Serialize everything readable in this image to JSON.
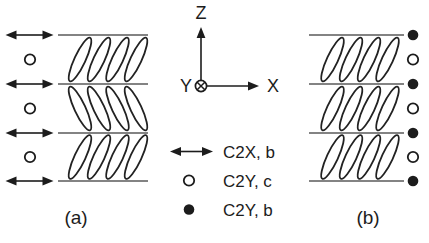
{
  "colors": {
    "background": "#ffffff",
    "ink": "#1c1c1c",
    "layer_line": "#5a5a5a"
  },
  "axes": {
    "z_label": "Z",
    "x_label": "X",
    "y_label": "Y",
    "y_direction_icon": "into-page-circled-x"
  },
  "legend": {
    "items": [
      {
        "symbol": "double-arrow",
        "label": "C2X, b"
      },
      {
        "symbol": "open-circle",
        "label": "C2Y, c"
      },
      {
        "symbol": "filled-circle",
        "label": "C2Y, b"
      }
    ]
  },
  "panels": [
    {
      "id": "a",
      "caption": "(a)",
      "lines_y": [
        35,
        84,
        133,
        181
      ],
      "line_x1": 58,
      "line_x2": 148,
      "ellipse_cx": [
        80,
        99,
        117.5,
        136
      ],
      "layer_tilts": [
        "right",
        "left",
        "right"
      ],
      "marker_x": 29.5,
      "line_marker": "double-arrow",
      "mid_marker": "open-circle"
    },
    {
      "id": "b",
      "caption": "(b)",
      "lines_y": [
        35,
        84,
        133,
        181
      ],
      "line_x1": 309,
      "line_x2": 404,
      "ellipse_cx": [
        332.5,
        351,
        369,
        387.5
      ],
      "layer_tilts": [
        "right",
        "right",
        "right"
      ],
      "marker_x": 413,
      "line_marker": "filled-circle",
      "mid_marker": "open-circle"
    }
  ]
}
